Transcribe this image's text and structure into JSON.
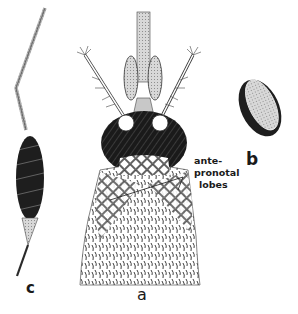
{
  "figure": {
    "panels": [
      {
        "id": "a",
        "label": "a",
        "subject": "head-and-thorax-dorsal-view"
      },
      {
        "id": "b",
        "label": "b",
        "subject": "egg"
      },
      {
        "id": "c",
        "label": "c",
        "subject": "plumose-antenna"
      }
    ],
    "annotation": {
      "line1": "ante-",
      "line2": "pronotal",
      "line3": "lobes"
    },
    "colors": {
      "ink": "#1a1a1a",
      "background": "#ffffff",
      "mid_gray": "#8a8a8a",
      "light_gray": "#c8c8c8"
    }
  }
}
